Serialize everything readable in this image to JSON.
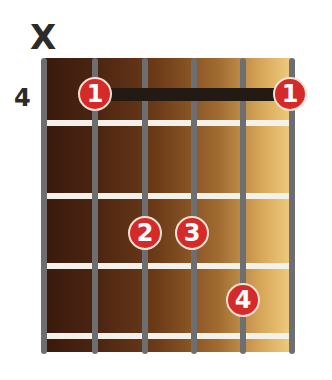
{
  "diagram": {
    "type": "guitar-chord-diagram",
    "starting_fret_label": "4",
    "muted_strings": [
      {
        "string": 1,
        "symbol": "X"
      }
    ],
    "colors": {
      "finger_dot": "#d52a2a",
      "string": "#6d6e70",
      "fret": "#f4f1ea",
      "barre": "#231a14",
      "board_dark": "#3a1a0c",
      "board_light": "#f0cc80"
    },
    "barre": {
      "finger": "1",
      "fret": 1,
      "from_string": 2,
      "to_string": 6
    },
    "fingers": [
      {
        "label": "1",
        "string": 2,
        "fret": 1
      },
      {
        "label": "1",
        "string": 6,
        "fret": 1
      },
      {
        "label": "2",
        "string": 3,
        "fret": 3
      },
      {
        "label": "3",
        "string": 4,
        "fret": 3
      },
      {
        "label": "4",
        "string": 5,
        "fret": 4
      }
    ]
  }
}
